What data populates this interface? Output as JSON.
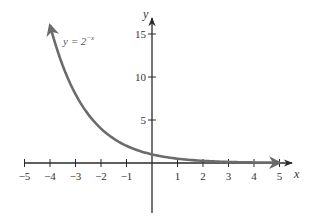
{
  "chart_data": {
    "type": "line",
    "title": "",
    "xlabel": "x",
    "ylabel": "y",
    "xlim": [
      -5,
      5
    ],
    "ylim": [
      -5,
      17
    ],
    "grid": false,
    "x_ticks": [
      -5,
      -4,
      -3,
      -2,
      -1,
      1,
      2,
      3,
      4,
      5
    ],
    "x_tick_labels": [
      "−5",
      "−4",
      "−3",
      "−2",
      "−1",
      "1",
      "2",
      "3",
      "4",
      "5"
    ],
    "y_ticks": [
      5,
      10,
      15
    ],
    "y_tick_labels": [
      "5",
      "10",
      "15"
    ],
    "series": [
      {
        "name": "y = 2^(-x)",
        "x": [
          -4,
          -3,
          -2,
          -1,
          0,
          1,
          2,
          3,
          4,
          5
        ],
        "y": [
          16,
          8,
          4,
          2,
          1,
          0.5,
          0.25,
          0.125,
          0.0625,
          0.03125
        ],
        "color": "#6b6b6b",
        "arrows": "both"
      }
    ],
    "annotations": [
      {
        "text_base": "y = 2",
        "text_exp": "−x",
        "x": -3.5,
        "y": 15
      }
    ]
  },
  "colors": {
    "axis": "#2a2a2a",
    "curve": "#6b6b6b",
    "text": "#333333"
  }
}
